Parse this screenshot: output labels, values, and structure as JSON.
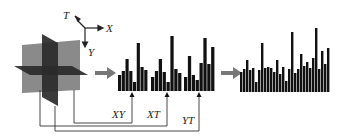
{
  "axes": {
    "t": "T",
    "x": "X",
    "y": "Y"
  },
  "plane_labels": [
    "XY",
    "XT",
    "YT"
  ],
  "colors": {
    "plane_light": "#8a8a8a",
    "plane_dark": "#2a2a2a",
    "bars": "#111111",
    "arrow": "#777777",
    "lines": "#333333"
  },
  "histograms": {
    "xy": [
      16,
      20,
      32,
      20,
      9,
      48,
      24,
      21
    ],
    "xt": [
      14,
      20,
      32,
      19,
      9,
      55,
      22,
      18
    ],
    "yt": [
      14,
      35,
      16,
      11,
      28,
      53,
      27,
      44
    ]
  },
  "concatenated": [
    20,
    23,
    32,
    22,
    24,
    10,
    22,
    49,
    24,
    25,
    24,
    20,
    32,
    18,
    25,
    11,
    23,
    60,
    19,
    23,
    38,
    26,
    30,
    24,
    34,
    64,
    23,
    41,
    28,
    44
  ]
}
